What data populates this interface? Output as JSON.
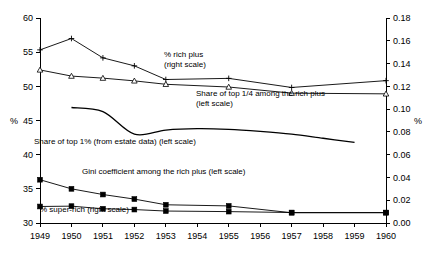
{
  "chart_data": {
    "type": "line",
    "title": "",
    "subtitle": "",
    "xlabel": "",
    "ylabel": "%",
    "ylabel_right": "%",
    "grid": false,
    "legend_position": "inline-annotations",
    "x": [
      1949,
      1950,
      1951,
      1952,
      1953,
      1954,
      1955,
      1956,
      1957,
      1958,
      1959,
      1960
    ],
    "categories": [
      "1949",
      "1950",
      "1951",
      "1952",
      "1953",
      "1954",
      "1955",
      "1956",
      "1957",
      "1958",
      "1959",
      "1960"
    ],
    "ylim": [
      30,
      60
    ],
    "yticks": [
      30,
      35,
      40,
      45,
      50,
      55,
      60
    ],
    "ytick_labels": [
      "30",
      "35",
      "40",
      "45",
      "50",
      "55",
      "60"
    ],
    "ylim_right": [
      0.0,
      0.18
    ],
    "yticks_right": [
      0.0,
      0.02,
      0.04,
      0.06,
      0.08,
      0.1,
      0.12,
      0.14,
      0.16,
      0.18
    ],
    "ytick_labels_right": [
      "0.00",
      "0.02",
      "0.04",
      "0.06",
      "0.08",
      "0.10",
      "0.12",
      "0.14",
      "0.16",
      "0.18"
    ],
    "series": [
      {
        "name": "% rich plus (right scale)",
        "axis": "right",
        "marker": "plus",
        "x": [
          1949,
          1950,
          1951,
          1952,
          1953,
          1955,
          1957,
          1960
        ],
        "values": [
          0.152,
          0.162,
          0.145,
          0.138,
          0.126,
          0.127,
          0.119,
          0.125
        ]
      },
      {
        "name": "Share of top 1/4 among the rich plus (left scale)",
        "axis": "left",
        "marker": "triangle",
        "x": [
          1949,
          1950,
          1951,
          1952,
          1953,
          1955,
          1957,
          1960
        ],
        "values": [
          52.4,
          51.5,
          51.2,
          50.8,
          50.3,
          49.9,
          49.0,
          48.9
        ]
      },
      {
        "name": "Share of top 1% (from estate data) (left scale)",
        "axis": "left",
        "marker": "none",
        "smooth": true,
        "x": [
          1950,
          1951,
          1952,
          1953,
          1954,
          1955,
          1956,
          1957,
          1958,
          1959
        ],
        "values": [
          46.9,
          46.3,
          43.0,
          43.6,
          43.8,
          43.7,
          43.4,
          43.0,
          42.4,
          41.8
        ]
      },
      {
        "name": "Gini coefficient among the rich plus (left scale)",
        "axis": "right",
        "marker": "square",
        "x": [
          1949,
          1950,
          1951,
          1952,
          1953,
          1955,
          1957,
          1960
        ],
        "values": [
          0.038,
          0.03,
          0.025,
          0.021,
          0.016,
          0.015,
          0.009,
          0.009
        ]
      },
      {
        "name": "% super-rich (right scale)",
        "axis": "right",
        "marker": "square",
        "x": [
          1949,
          1950,
          1951,
          1952,
          1953,
          1955,
          1957,
          1960
        ],
        "values": [
          0.0145,
          0.0148,
          0.0125,
          0.0118,
          0.0105,
          0.01,
          0.0092,
          0.0092
        ]
      }
    ],
    "annotations": [
      {
        "id": "rich-plus",
        "lines": [
          "% rich plus",
          "(right scale)"
        ],
        "x": 164,
        "y": 57
      },
      {
        "id": "top-quarter",
        "lines": [
          "Share of top 1/4 among the rich plus",
          "(left scale)"
        ],
        "x": 196,
        "y": 96
      },
      {
        "id": "top-one-percent",
        "lines": [
          "Share of top 1% (from estate data) (left scale)"
        ],
        "x": 34,
        "y": 144
      },
      {
        "id": "gini",
        "lines": [
          "Gini coefficient among the rich plus (left scale)"
        ],
        "x": 82,
        "y": 174
      },
      {
        "id": "super-rich",
        "lines": [
          "% super-rich   (right scale)"
        ],
        "x": 40,
        "y": 212
      }
    ]
  }
}
